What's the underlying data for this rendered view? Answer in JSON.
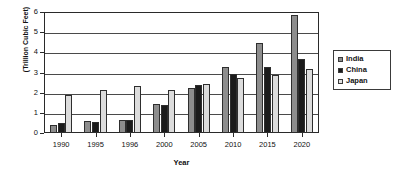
{
  "chart_data": {
    "type": "bar",
    "title": "",
    "xlabel": "Year",
    "ylabel": "(Trillion Cubic Feet)",
    "categories": [
      "1990",
      "1995",
      "1996",
      "2000",
      "2005",
      "2010",
      "2015",
      "2020"
    ],
    "series": [
      {
        "name": "India",
        "color": "#8d8d8d",
        "values": [
          0.38,
          0.58,
          0.65,
          1.46,
          2.25,
          3.25,
          4.46,
          5.87
        ]
      },
      {
        "name": "China",
        "color": "#1b1b1b",
        "values": [
          0.48,
          0.57,
          0.66,
          1.38,
          2.37,
          2.95,
          3.27,
          3.67
        ]
      },
      {
        "name": "Japan",
        "color": "#dcdcdc",
        "values": [
          1.87,
          2.15,
          2.32,
          2.15,
          2.44,
          2.75,
          2.86,
          3.15
        ]
      }
    ],
    "ylim": [
      0,
      6
    ],
    "yticks": [
      0,
      1,
      2,
      3,
      4,
      5,
      6
    ],
    "ytick_labels": [
      "0",
      "1",
      "2",
      "3",
      "4",
      "5",
      "6"
    ],
    "grid": true,
    "legend_position": "right"
  },
  "legend": {
    "entries": [
      {
        "label": "India"
      },
      {
        "label": "China"
      },
      {
        "label": "Japan"
      }
    ]
  }
}
